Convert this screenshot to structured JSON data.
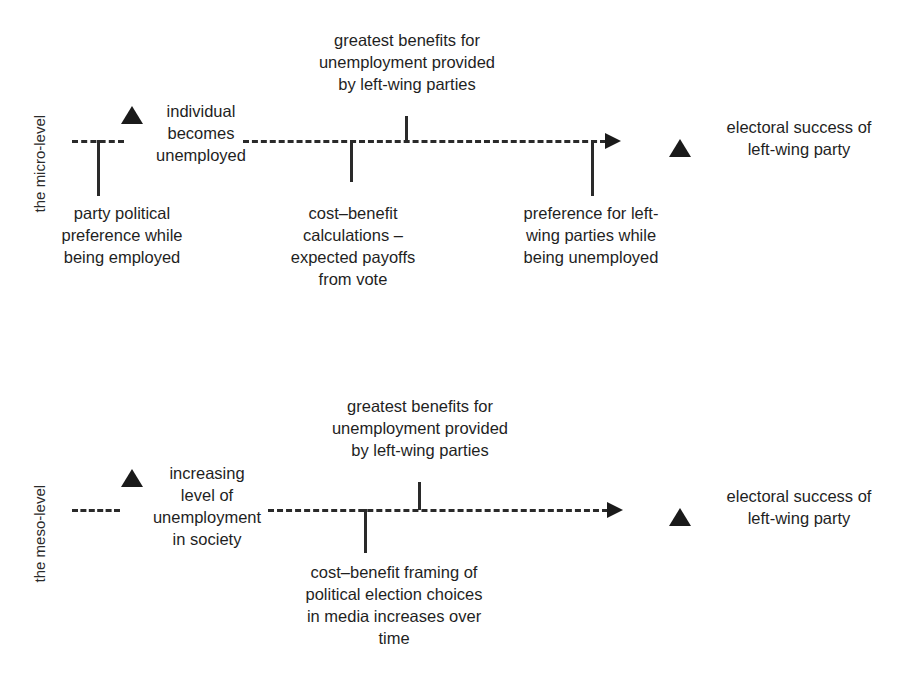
{
  "figure": {
    "type": "diagram",
    "panels": [
      {
        "id": "micro",
        "level_label": "the micro-level",
        "start_node": {
          "marker": "triangle-marker",
          "label": "individual\nbecomes\nunemployed"
        },
        "end_node": {
          "marker": "triangle-marker",
          "label": "electoral success of\nleft-wing party"
        },
        "above_line_annotation": "greatest benefits for\nunemployment provided\nby left-wing parties",
        "below_line_annotations": [
          "party political\npreference while\nbeing employed",
          "cost–benefit\ncalculations –\nexpected payoffs\nfrom vote",
          "preference for left-\nwing parties while\nbeing unemployed"
        ]
      },
      {
        "id": "meso",
        "level_label": "the meso-level",
        "start_node": {
          "marker": "triangle-marker",
          "label": "increasing\nlevel of\nunemployment\nin society"
        },
        "end_node": {
          "marker": "triangle-marker",
          "label": "electoral success of\nleft-wing party"
        },
        "above_line_annotation": "greatest benefits for\nunemployment provided\nby left-wing parties",
        "below_line_annotations": [
          "cost–benefit framing of\npolitical election choices\nin media increases over\ntime"
        ]
      }
    ],
    "colors": {
      "ink": "#1a1a1a",
      "line": "#2a2a2a",
      "background": "#ffffff"
    }
  }
}
